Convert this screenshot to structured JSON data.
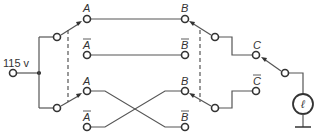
{
  "diagram": {
    "type": "three-way switch circuit",
    "source_label": "115 v",
    "terminals": {
      "a_top": "A",
      "a_bar_top": "A",
      "a_bottom": "A",
      "a_bar_bottom": "A",
      "b_top": "B",
      "b_bar_top": "B",
      "b_bottom": "B",
      "b_bar_bottom": "B",
      "c": "C",
      "c_bar": "C"
    },
    "lamp_symbol": "ℓ",
    "colors": {
      "line": "#555555",
      "terminal": "#333333",
      "background": "#ffffff"
    }
  }
}
